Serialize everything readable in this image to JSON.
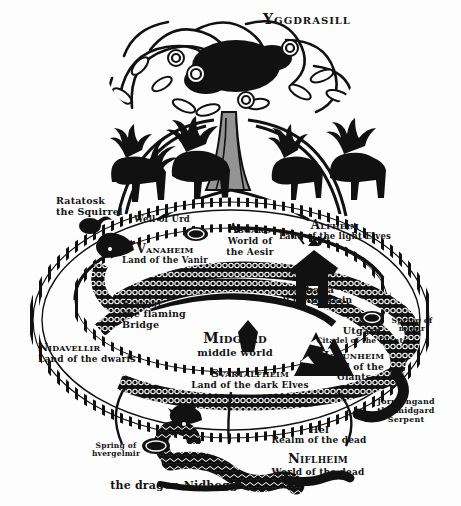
{
  "figure": {
    "title": "Yggdrasill",
    "background_color": "#fdfdfd",
    "ink_color": "#131313"
  },
  "labels": {
    "yggdrasill": {
      "title": "Yggdrasill",
      "subtitle": ""
    },
    "ratatosk": {
      "title": "Ratatosk",
      "subtitle": "the Squirrel"
    },
    "well_of_urd": {
      "title": "Well of Urd",
      "subtitle": ""
    },
    "asgard": {
      "title": "Asgard",
      "subtitle": "World of\nthe Aesir"
    },
    "alfheim": {
      "title": "Alfheim",
      "subtitle": "Land of the light Elves"
    },
    "vanaheim": {
      "title": "Vanaheim",
      "subtitle": "Land of the Vanir"
    },
    "valhalla": {
      "title": "Valhalla",
      "subtitle": "hall of the slain"
    },
    "bifrost": {
      "title": "Bifrost",
      "subtitle": "the flaming\nBridge"
    },
    "midgard": {
      "title": "Midgard",
      "subtitle": "middle world"
    },
    "nidavellir": {
      "title": "Nidavellir",
      "subtitle": "Land of the dwarfs"
    },
    "utgard": {
      "title": "Utgard",
      "subtitle": "Citadel of the Giants"
    },
    "jotunheim": {
      "title": "Jotunheim",
      "subtitle": "Land of the\nGiants"
    },
    "spring_of_mimir": {
      "title": "Spring of",
      "subtitle": "mimir"
    },
    "svartalfheim": {
      "title": "Svartalfheim",
      "subtitle": "Land of the dark Elves"
    },
    "jormungand": {
      "title": "Jormungand",
      "subtitle": "the midgard\nSerpent"
    },
    "hel": {
      "title": "Hel",
      "subtitle": "Realm of the dead"
    },
    "niflheim": {
      "title": "Niflheim",
      "subtitle": "World of the dead"
    },
    "spring_of_hvergelmir": {
      "title": "Spring of",
      "subtitle": "hvergelmir"
    },
    "nidhogg": {
      "title": "the dragon Nidhogg",
      "subtitle": ""
    }
  }
}
